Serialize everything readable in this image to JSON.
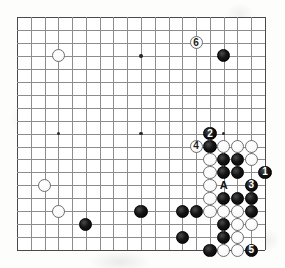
{
  "diagram": {
    "kind": "go-board-diagram",
    "board_size": 19,
    "origin_x": 17,
    "origin_y": 17,
    "spacing_x": 13.78,
    "spacing_y": 12.95,
    "stone_radius": 6.6,
    "colors": {
      "black_stone": "#101010",
      "white_stone": "#ffffff",
      "grid_line": "#8d8d8d",
      "board_edge": "#4a4a4a",
      "background": "#fdfdfc",
      "label_on_black": "#ffffff",
      "label_on_white": "#1a1a1a"
    },
    "star_points": [
      {
        "col": 4,
        "row": 4
      },
      {
        "col": 10,
        "row": 4
      },
      {
        "col": 16,
        "row": 4
      },
      {
        "col": 4,
        "row": 10
      },
      {
        "col": 10,
        "row": 10
      },
      {
        "col": 16,
        "row": 10
      },
      {
        "col": 4,
        "row": 16
      },
      {
        "col": 10,
        "row": 16
      },
      {
        "col": 16,
        "row": 16
      }
    ],
    "stones": [
      {
        "col": 4,
        "row": 4,
        "color": "white",
        "label": ""
      },
      {
        "col": 16,
        "row": 4,
        "color": "black",
        "label": ""
      },
      {
        "col": 14,
        "row": 3,
        "color": "white",
        "label": "6"
      },
      {
        "col": 3,
        "row": 14,
        "color": "white",
        "label": ""
      },
      {
        "col": 4,
        "row": 16,
        "color": "white",
        "label": ""
      },
      {
        "col": 6,
        "row": 17,
        "color": "black",
        "label": ""
      },
      {
        "col": 10,
        "row": 16,
        "color": "black",
        "label": ""
      },
      {
        "col": 15,
        "row": 10,
        "color": "black",
        "label": "2"
      },
      {
        "col": 14,
        "row": 11,
        "color": "white",
        "label": "4"
      },
      {
        "col": 15,
        "row": 11,
        "color": "black",
        "label": ""
      },
      {
        "col": 16,
        "row": 11,
        "color": "white",
        "label": ""
      },
      {
        "col": 17,
        "row": 11,
        "color": "white",
        "label": ""
      },
      {
        "col": 18,
        "row": 11,
        "color": "white",
        "label": ""
      },
      {
        "col": 15,
        "row": 12,
        "color": "white",
        "label": ""
      },
      {
        "col": 16,
        "row": 12,
        "color": "black",
        "label": ""
      },
      {
        "col": 17,
        "row": 12,
        "color": "black",
        "label": ""
      },
      {
        "col": 18,
        "row": 12,
        "color": "white",
        "label": ""
      },
      {
        "col": 15,
        "row": 13,
        "color": "white",
        "label": ""
      },
      {
        "col": 16,
        "row": 13,
        "color": "black",
        "label": ""
      },
      {
        "col": 17,
        "row": 13,
        "color": "black",
        "label": ""
      },
      {
        "col": 19,
        "row": 13,
        "color": "black",
        "label": "1"
      },
      {
        "col": 15,
        "row": 14,
        "color": "white",
        "label": ""
      },
      {
        "col": 18,
        "row": 14,
        "color": "black",
        "label": "3"
      },
      {
        "col": 15,
        "row": 15,
        "color": "white",
        "label": ""
      },
      {
        "col": 16,
        "row": 15,
        "color": "black",
        "label": ""
      },
      {
        "col": 17,
        "row": 15,
        "color": "black",
        "label": ""
      },
      {
        "col": 18,
        "row": 15,
        "color": "black",
        "label": ""
      },
      {
        "col": 13,
        "row": 16,
        "color": "black",
        "label": ""
      },
      {
        "col": 14,
        "row": 16,
        "color": "black",
        "label": ""
      },
      {
        "col": 15,
        "row": 16,
        "color": "white",
        "label": ""
      },
      {
        "col": 16,
        "row": 16,
        "color": "white",
        "label": ""
      },
      {
        "col": 17,
        "row": 16,
        "color": "white",
        "label": ""
      },
      {
        "col": 18,
        "row": 16,
        "color": "black",
        "label": ""
      },
      {
        "col": 16,
        "row": 17,
        "color": "black",
        "label": ""
      },
      {
        "col": 17,
        "row": 17,
        "color": "white",
        "label": ""
      },
      {
        "col": 18,
        "row": 17,
        "color": "white",
        "label": ""
      },
      {
        "col": 13,
        "row": 18,
        "color": "black",
        "label": ""
      },
      {
        "col": 16,
        "row": 18,
        "color": "black",
        "label": ""
      },
      {
        "col": 17,
        "row": 18,
        "color": "white",
        "label": ""
      },
      {
        "col": 15,
        "row": 19,
        "color": "black",
        "label": ""
      },
      {
        "col": 16,
        "row": 19,
        "color": "white",
        "label": ""
      },
      {
        "col": 17,
        "row": 19,
        "color": "white",
        "label": ""
      },
      {
        "col": 18,
        "row": 19,
        "color": "black",
        "label": "5"
      }
    ],
    "point_markers": [
      {
        "col": 16,
        "row": 14,
        "text": "A"
      }
    ],
    "move_numbers": [
      "1",
      "2",
      "3",
      "4",
      "5",
      "6"
    ]
  }
}
